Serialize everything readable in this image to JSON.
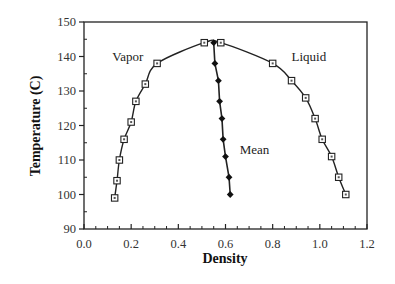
{
  "chart_data": {
    "type": "line",
    "title": "",
    "xlabel": "Density",
    "ylabel": "Temperature (C)",
    "xlim": [
      0.0,
      1.2
    ],
    "ylim": [
      90,
      150
    ],
    "xticks": [
      "0.0",
      "0.2",
      "0.4",
      "0.6",
      "0.8",
      "1.0",
      "1.2"
    ],
    "yticks": [
      "90",
      "100",
      "110",
      "120",
      "130",
      "140",
      "150"
    ],
    "grid": false,
    "legend": "none (inline annotations)",
    "annotations": [
      {
        "text": "Vapor",
        "x": 0.12,
        "y": 140
      },
      {
        "text": "Liquid",
        "x": 0.88,
        "y": 140
      },
      {
        "text": "Mean",
        "x": 0.66,
        "y": 113
      }
    ],
    "series": [
      {
        "name": "Vapor",
        "marker": "open-square",
        "x": [
          0.13,
          0.14,
          0.15,
          0.17,
          0.2,
          0.22,
          0.26,
          0.31,
          0.51
        ],
        "y": [
          99,
          104,
          110,
          116,
          121,
          127,
          132,
          138,
          144
        ]
      },
      {
        "name": "Liquid",
        "marker": "open-square",
        "x": [
          0.58,
          0.8,
          0.88,
          0.94,
          0.98,
          1.01,
          1.05,
          1.08,
          1.11
        ],
        "y": [
          144,
          138,
          133,
          128,
          122,
          116,
          111,
          105,
          100
        ]
      },
      {
        "name": "Mean",
        "marker": "filled-diamond",
        "x": [
          0.55,
          0.555,
          0.57,
          0.575,
          0.585,
          0.59,
          0.6,
          0.615,
          0.62
        ],
        "y": [
          144,
          138,
          133,
          127,
          122,
          116,
          111,
          105,
          100
        ]
      }
    ]
  }
}
